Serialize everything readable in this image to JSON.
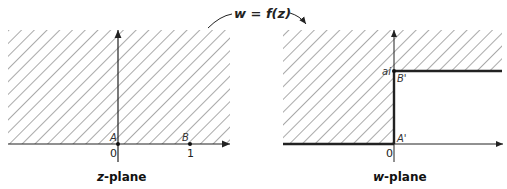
{
  "mapping": {
    "label": "w = f(z)",
    "label_w": "w",
    "label_eq": " = ",
    "label_f": "f(z)"
  },
  "z_plane": {
    "caption": "z-plane",
    "caption_var": "z",
    "caption_rest": "-plane",
    "origin_tick": "0",
    "one_tick": "1",
    "point_A": "A",
    "point_B": "B",
    "shaded_region": "upper half-plane"
  },
  "w_plane": {
    "caption": "w-plane",
    "caption_var": "w",
    "caption_rest": "-plane",
    "origin_tick": "0",
    "ai_tick": "ai",
    "point_A": "A'",
    "point_B": "B'",
    "shaded_region": "upper half-plane minus quarter strip region right of imaginary axis below ai"
  },
  "colors": {
    "hatch": "#555555",
    "axis": "#222222",
    "boundary": "#222222"
  }
}
